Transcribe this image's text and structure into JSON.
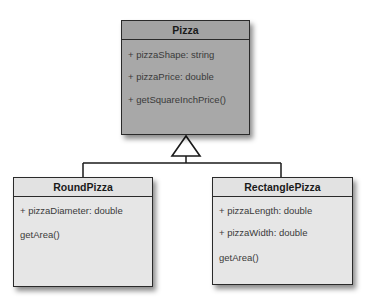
{
  "diagram": {
    "type": "UML class diagram",
    "parent_class": {
      "name": "Pizza",
      "members": [
        "+ pizzaShape: string",
        "+ pizzaPrice: double",
        "+ getSquareInchPrice()"
      ]
    },
    "child_classes": [
      {
        "name": "RoundPizza",
        "members": [
          "+ pizzaDiameter: double",
          "getArea()"
        ]
      },
      {
        "name": "RectanglePizza",
        "members": [
          "+ pizzaLength: double",
          "+ pizzaWidth: double",
          "getArea()"
        ]
      }
    ],
    "relationship": "inheritance (generalization)",
    "colors": {
      "parent_fill": "#a8a8a8",
      "child_fill": "#e6e6e6",
      "border": "#2a2a2a"
    }
  }
}
